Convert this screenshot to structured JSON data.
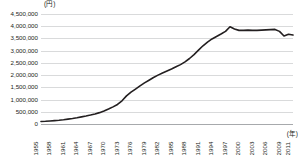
{
  "chart_data": {
    "type": "line",
    "title": "",
    "subtitle": "",
    "xlabel": "(年)",
    "ylabel": "(円)",
    "ylim": [
      0,
      4500000
    ],
    "ytick_step": 500000,
    "xlim": [
      1955,
      2011
    ],
    "grid": true,
    "legend_position": "none",
    "series_color": "#231f20",
    "yticks": [
      "4,500,000",
      "4,000,000",
      "3,500,000",
      "3,000,000",
      "2,500,000",
      "2,000,000",
      "1,500,000",
      "1,000,000",
      "500,000",
      "0"
    ],
    "ytick_values": [
      4500000,
      4000000,
      3500000,
      3000000,
      2500000,
      2000000,
      1500000,
      1000000,
      500000,
      0
    ],
    "xticks": [
      "1955",
      "1958",
      "1961",
      "1964",
      "1967",
      "1970",
      "1973",
      "1976",
      "1979",
      "1982",
      "1985",
      "1988",
      "1991",
      "1994",
      "1997",
      "2000",
      "2003",
      "2006",
      "2009",
      "2011"
    ],
    "xtick_values": [
      1955,
      1958,
      1961,
      1964,
      1967,
      1970,
      1973,
      1976,
      1979,
      1982,
      1985,
      1988,
      1991,
      1994,
      1997,
      2000,
      2003,
      2006,
      2009,
      2011
    ],
    "x": [
      1955,
      1956,
      1957,
      1958,
      1959,
      1960,
      1961,
      1962,
      1963,
      1964,
      1965,
      1966,
      1967,
      1968,
      1969,
      1970,
      1971,
      1972,
      1973,
      1974,
      1975,
      1976,
      1977,
      1978,
      1979,
      1980,
      1981,
      1982,
      1983,
      1984,
      1985,
      1986,
      1987,
      1988,
      1989,
      1990,
      1991,
      1992,
      1993,
      1994,
      1995,
      1996,
      1997,
      1998,
      1999,
      2000,
      2001,
      2002,
      2003,
      2004,
      2005,
      2006,
      2007,
      2008,
      2009,
      2010,
      2011
    ],
    "values": [
      100000,
      110000,
      125000,
      140000,
      155000,
      175000,
      200000,
      225000,
      255000,
      290000,
      325000,
      365000,
      410000,
      465000,
      530000,
      610000,
      700000,
      800000,
      950000,
      1150000,
      1300000,
      1430000,
      1560000,
      1680000,
      1790000,
      1900000,
      2000000,
      2090000,
      2170000,
      2250000,
      2340000,
      2430000,
      2540000,
      2680000,
      2840000,
      3020000,
      3200000,
      3350000,
      3480000,
      3580000,
      3680000,
      3790000,
      3980000,
      3890000,
      3830000,
      3830000,
      3840000,
      3830000,
      3830000,
      3840000,
      3850000,
      3860000,
      3870000,
      3790000,
      3600000,
      3670000,
      3640000
    ],
    "annotations": []
  }
}
